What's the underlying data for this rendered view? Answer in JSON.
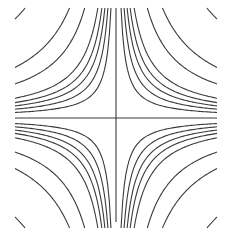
{
  "chart_data": {
    "type": "contour",
    "title": "",
    "xlabel": "",
    "ylabel": "",
    "function": "x*y",
    "xlim": [
      -1,
      1
    ],
    "ylim": [
      -1,
      1
    ],
    "grid": false,
    "legend": null,
    "levels_positive": [
      0.05,
      0.08,
      0.11,
      0.14,
      0.18,
      0.31,
      0.46,
      0.9
    ],
    "levels_negative": [
      -0.05,
      -0.08,
      -0.11,
      -0.14,
      -0.18,
      -0.31,
      -0.46,
      -0.9
    ],
    "zero_level": 0,
    "line_color": "#3a3a3a",
    "background_color": "#ffffff"
  },
  "plot_frame": {
    "left": 15,
    "top": 8,
    "right": 217,
    "bottom": 222,
    "center_x": 116,
    "center_y": 118
  }
}
